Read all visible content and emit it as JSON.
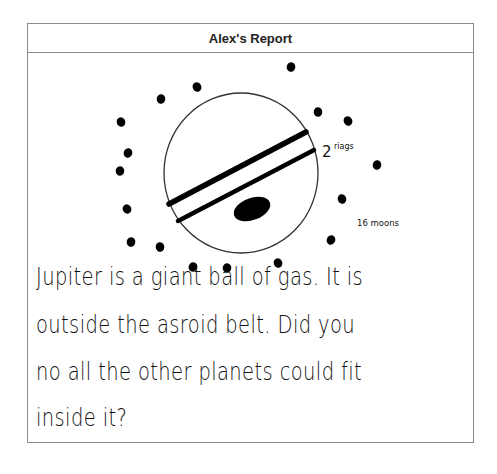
{
  "report": {
    "title": "Alex's Report"
  },
  "drawing": {
    "subject": "Jupiter",
    "labels": {
      "rings": "2 riags",
      "moons": "16 moons"
    },
    "colors": {
      "ink": "#000000",
      "outline": "#333333",
      "border": "#8a8a8a"
    },
    "planet": {
      "cx": 241,
      "cy": 173,
      "rx": 77,
      "ry": 80
    },
    "rings": [
      {
        "x1": 169,
        "y1": 204,
        "x2": 306,
        "y2": 132,
        "width": 5.5
      },
      {
        "x1": 178,
        "y1": 221,
        "x2": 314,
        "y2": 150,
        "width": 4.5
      }
    ],
    "spot": {
      "cx": 252,
      "cy": 209,
      "rx": 19,
      "ry": 11,
      "rotate": -20
    },
    "moons": [
      {
        "cx": 197,
        "cy": 87
      },
      {
        "cx": 161,
        "cy": 99
      },
      {
        "cx": 121,
        "cy": 122
      },
      {
        "cx": 128,
        "cy": 153
      },
      {
        "cx": 120,
        "cy": 171
      },
      {
        "cx": 127,
        "cy": 209
      },
      {
        "cx": 131,
        "cy": 242
      },
      {
        "cx": 160,
        "cy": 247
      },
      {
        "cx": 193,
        "cy": 267
      },
      {
        "cx": 227,
        "cy": 268
      },
      {
        "cx": 278,
        "cy": 263
      },
      {
        "cx": 291,
        "cy": 67
      },
      {
        "cx": 318,
        "cy": 112
      },
      {
        "cx": 348,
        "cy": 121
      },
      {
        "cx": 377,
        "cy": 165
      },
      {
        "cx": 342,
        "cy": 199
      },
      {
        "cx": 331,
        "cy": 240
      }
    ]
  },
  "text": {
    "lines": [
      "Jupiter is a  giant ball of gas.  It is",
      "outside  the asroid  belt.  Did  you",
      "no  all the other planets  could fit",
      "inside it?"
    ]
  }
}
